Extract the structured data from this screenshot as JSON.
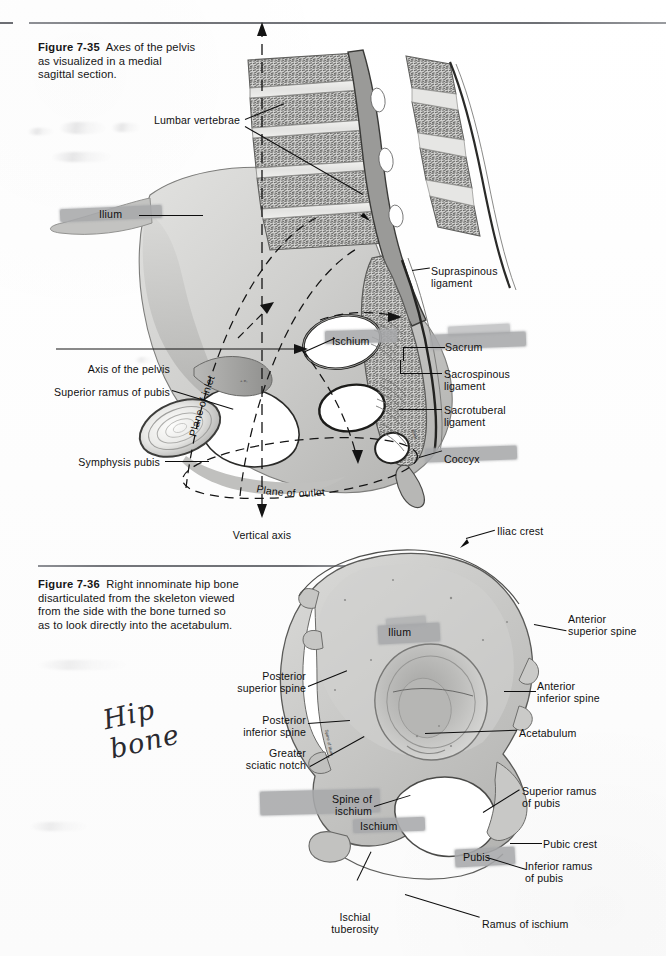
{
  "page": {
    "background_color": "#fefefe",
    "ink_color": "#101010",
    "highlighter_color": "#a8a9ab"
  },
  "figure_735": {
    "number": "Figure 7-35",
    "caption": "Axes of the pelvis as visualized in a medial sagittal section.",
    "caption_line1": "Axes of the pelvis",
    "caption_line2": "as visualized in a medial",
    "caption_line3": "sagittal section.",
    "labels": {
      "lumbar_vertebrae": "Lumbar vertebrae",
      "ilium": "Ilium",
      "supraspinous_ligament_l1": "Supraspinous",
      "supraspinous_ligament_l2": "ligament",
      "ischium": "Ischium",
      "sacrum": "Sacrum",
      "axis_of_the_pelvis": "Axis of the pelvis",
      "sacrospinous_ligament_l1": "Sacrospinous",
      "sacrospinous_ligament_l2": "ligament",
      "superior_ramus_of_pubis": "Superior ramus of pubis",
      "sacrotuberal_ligament_l1": "Sacrotuberal",
      "sacrotuberal_ligament_l2": "ligament",
      "symphysis_pubis": "Symphysis pubis",
      "coccyx": "Coccyx",
      "plane_of_inlet": "Plane of inlet",
      "plane_of_outlet": "Plane of outlet",
      "vertical_axis": "Vertical axis"
    },
    "highlighted_labels": [
      "Ilium",
      "Ischium",
      "Sacrum",
      "Coccyx"
    ]
  },
  "figure_736": {
    "number": "Figure 7-36",
    "caption": "Right innominate hip bone disarticulated from the skeleton viewed from the side with the bone turned so as to look directly into the acetabulum.",
    "caption_line1": "Right innominate hip bone",
    "caption_line2": "disarticulated from the skeleton viewed",
    "caption_line3": "from the side with the bone turned so",
    "caption_line4": "as to look directly into the acetabulum.",
    "labels": {
      "iliac_crest": "Iliac crest",
      "ilium": "Ilium",
      "anterior_superior_spine_l1": "Anterior",
      "anterior_superior_spine_l2": "superior spine",
      "posterior_superior_spine_l1": "Posterior",
      "posterior_superior_spine_l2": "superior spine",
      "anterior_inferior_spine_l1": "Anterior",
      "anterior_inferior_spine_l2": "inferior spine",
      "posterior_inferior_spine_l1": "Posterior",
      "posterior_inferior_spine_l2": "inferior spine",
      "acetabulum": "Acetabulum",
      "greater_sciatic_notch_l1": "Greater",
      "greater_sciatic_notch_l2": "sciatic notch",
      "superior_ramus_of_pubis_l1": "Superior ramus",
      "superior_ramus_of_pubis_l2": "of pubis",
      "spine_of_ischium_l1": "Spine of",
      "spine_of_ischium_l2": "ischium",
      "ischium": "Ischium",
      "pubic_crest": "Pubic crest",
      "pubis": "Pubis",
      "inferior_ramus_of_pubis_l1": "Inferior ramus",
      "inferior_ramus_of_pubis_l2": "of pubis",
      "ischial_tuberosity_l1": "Ischial",
      "ischial_tuberosity_l2": "tuberosity",
      "ramus_of_ischium": "Ramus of ischium"
    },
    "highlighted_labels": [
      "Ilium",
      "Spine of ischium",
      "Ischium",
      "Pubis"
    ]
  },
  "annotations": {
    "handwritten_line1": "Hip",
    "handwritten_line2": "bone"
  }
}
